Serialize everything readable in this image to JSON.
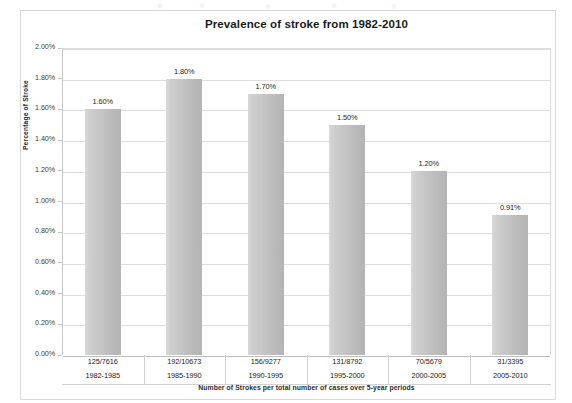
{
  "chart_data": {
    "type": "bar",
    "title": "Prevalence of stroke from 1982-2010",
    "xlabel": "Number of Strokes per total number of cases over 5-year periods",
    "ylabel": "Percentage of Stroke",
    "ylim": [
      0,
      2.0
    ],
    "ytick_step": 0.2,
    "ytick_labels": [
      "2.00%",
      "1.80%",
      "1.60%",
      "1.40%",
      "1.20%",
      "1.00%",
      "0.80%",
      "0.60%",
      "0.40%",
      "0.20%",
      "0.00%"
    ],
    "ytick_values": [
      2.0,
      1.8,
      1.6,
      1.4,
      1.2,
      1.0,
      0.8,
      0.6,
      0.4,
      0.2,
      0.0
    ],
    "grid": true,
    "legend": false,
    "categories": [
      "1982-1985",
      "1985-1990",
      "1990-1995",
      "1995-2000",
      "2000-2005",
      "2005-2010"
    ],
    "category_ratios": [
      "125/7616",
      "192/10673",
      "156/9277",
      "131/8792",
      "70/5679",
      "31/3395"
    ],
    "values": [
      1.6,
      1.8,
      1.7,
      1.5,
      1.2,
      0.91
    ],
    "data_labels": [
      "1.60%",
      "1.80%",
      "1.70%",
      "1.50%",
      "1.20%",
      "0.91%"
    ],
    "bar_color": "#c4c4c4",
    "gridline_color": "#dedede",
    "bars": [
      {
        "ratio": "125/7616",
        "period": "1982-1985",
        "value": 1.6,
        "label": "1.60%"
      },
      {
        "ratio": "192/10673",
        "period": "1985-1990",
        "value": 1.8,
        "label": "1.80%"
      },
      {
        "ratio": "156/9277",
        "period": "1990-1995",
        "value": 1.7,
        "label": "1.70%"
      },
      {
        "ratio": "131/8792",
        "period": "1995-2000",
        "value": 1.5,
        "label": "1.50%"
      },
      {
        "ratio": "70/5679",
        "period": "2000-2005",
        "value": 1.2,
        "label": "1.20%"
      },
      {
        "ratio": "31/3395",
        "period": "2005-2010",
        "value": 0.91,
        "label": "0.91%"
      }
    ]
  }
}
